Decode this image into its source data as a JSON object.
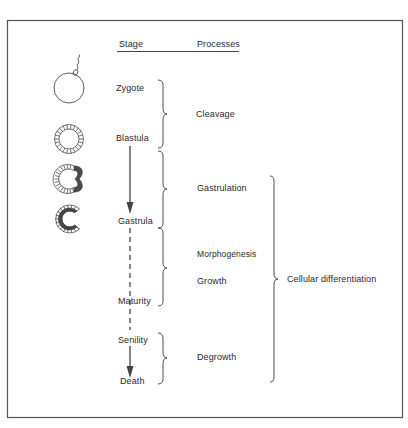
{
  "header": {
    "stage_label": "Stage",
    "processes_label": "Processes"
  },
  "stages": [
    {
      "label": "Zygote"
    },
    {
      "label": "Blastula"
    },
    {
      "label": "Gastrula"
    },
    {
      "label": "Maturity"
    },
    {
      "label": "Senility"
    },
    {
      "label": "Death"
    }
  ],
  "processes": [
    {
      "label": "Cleavage"
    },
    {
      "label": "Gastrulation"
    },
    {
      "label": "Morphogenesis"
    },
    {
      "label": "Growth"
    },
    {
      "label": "Degrowth"
    }
  ],
  "overall_process": {
    "label": "Cellular differentiation"
  },
  "icons": [
    {
      "name": "zygote-with-sperm-icon"
    },
    {
      "name": "blastula-icon"
    },
    {
      "name": "early-gastrula-icon"
    },
    {
      "name": "gastrula-icon"
    }
  ],
  "colors": {
    "line": "#3a3a3a",
    "text": "#2a2a2a",
    "cell_dark": "#4a4a4a",
    "frame": "#555555"
  }
}
